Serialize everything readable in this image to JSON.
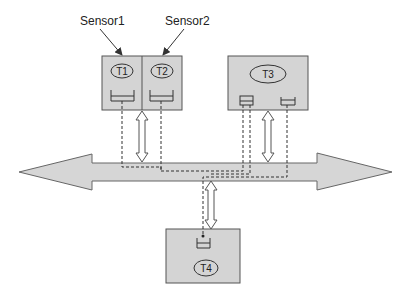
{
  "diagram": {
    "colors": {
      "box_fill": "#d4d4d4",
      "bus_fill": "#d6d6d6",
      "stroke": "#555555",
      "dash": "#333333"
    },
    "labels": {
      "sensor1": "Sensor1",
      "sensor2": "Sensor2"
    },
    "nodes": {
      "t1": "T1",
      "t2": "T2",
      "t3": "T3",
      "t4": "T4"
    },
    "bus": "bidirectional bus",
    "links": [
      {
        "from": "T1/T2",
        "to": "bus",
        "type": "double-arrow"
      },
      {
        "from": "T3",
        "to": "bus",
        "type": "double-arrow"
      },
      {
        "from": "bus",
        "to": "T4",
        "type": "double-arrow"
      }
    ]
  }
}
